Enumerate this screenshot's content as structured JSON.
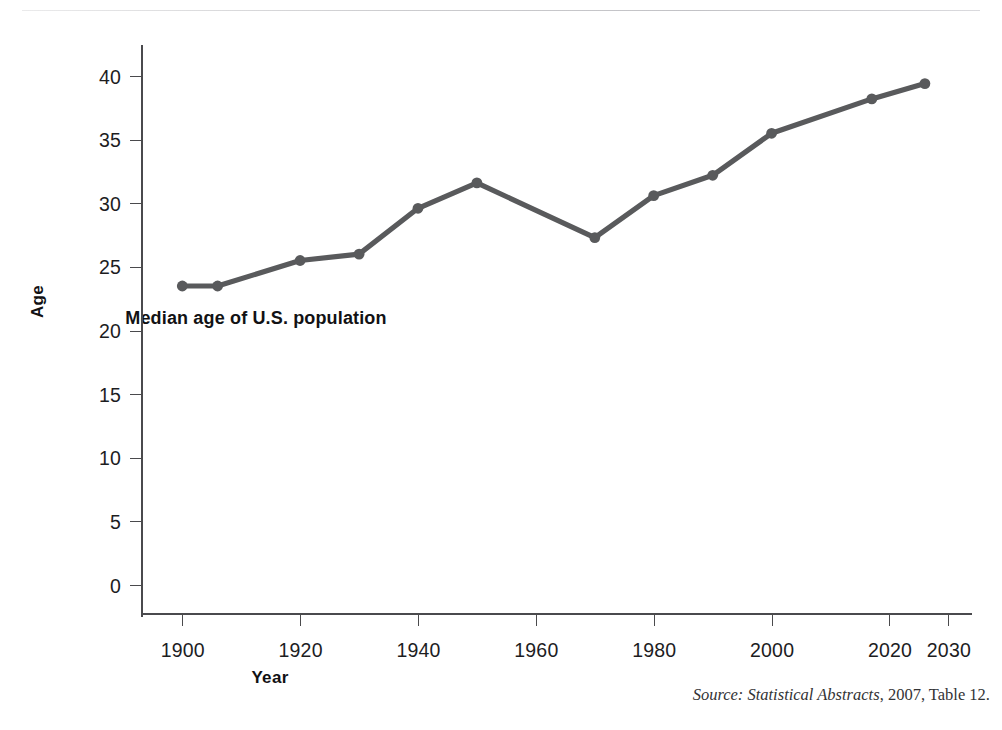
{
  "figure": {
    "ylabel": "Age",
    "xlabel": "Year",
    "annotation": "Median age of U.S. population",
    "source_prefix": "Source:",
    "source_title": "Statistical Abstracts",
    "source_suffix": ", 2007, Table 12.",
    "line_color": "#595a5c",
    "axis_color": "#4a4a4d",
    "text_color": "#1d1d1f",
    "rule_color": "#c9c9cc",
    "background": "#ffffff"
  },
  "chart_data": {
    "type": "line",
    "title": "Median age of U.S. population",
    "xlabel": "Year",
    "ylabel": "Age",
    "xlim": [
      1893,
      2034
    ],
    "ylim": [
      0,
      41
    ],
    "grid": false,
    "legend": "none",
    "xticks": [
      1900,
      1920,
      1940,
      1960,
      1980,
      2000,
      2020,
      2030
    ],
    "xtick_labels": [
      "1900",
      "1920",
      "1940",
      "1960",
      "1980",
      "2000",
      "2020",
      "2030"
    ],
    "yticks": [
      0,
      5,
      10,
      15,
      20,
      25,
      30,
      35,
      40
    ],
    "ytick_labels": [
      "0",
      "5",
      "10",
      "15",
      "20",
      "25",
      "30",
      "35",
      "40"
    ],
    "series": [
      {
        "name": "Median age of U.S. population",
        "marker": "circle",
        "color": "#595a5c",
        "x": [
          1900,
          1906,
          1920,
          1930,
          1940,
          1950,
          1970,
          1980,
          1990,
          2000,
          2017,
          2026
        ],
        "y": [
          23.5,
          23.5,
          25.5,
          26.0,
          29.6,
          31.6,
          27.3,
          30.6,
          32.2,
          35.5,
          38.2,
          39.4
        ]
      }
    ],
    "annotations": [
      {
        "text": "Source: Statistical Abstracts, 2007, Table 12."
      }
    ]
  }
}
